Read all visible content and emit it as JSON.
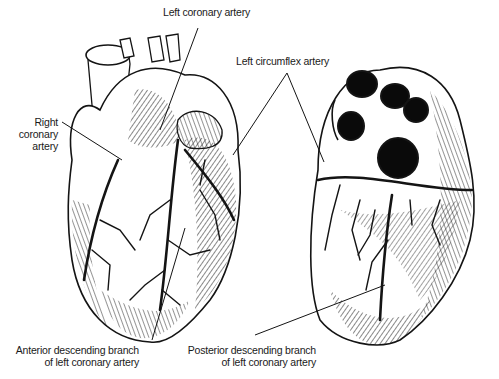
{
  "figure": {
    "views": [
      "anterior-view",
      "posterior-view"
    ],
    "colors": {
      "ink": "#141414",
      "background": "#ffffff",
      "cavity": "#0a0a0a"
    }
  },
  "labels": {
    "left_coronary_artery": "Left coronary artery",
    "left_circumflex_artery": "Left circumflex artery",
    "right_coronary_artery": [
      "Right",
      "coronary",
      "artery"
    ],
    "anterior_descending": [
      "Anterior descending branch",
      "of left coronary artery"
    ],
    "posterior_descending": [
      "Posterior descending branch",
      "of left coronary artery"
    ]
  }
}
